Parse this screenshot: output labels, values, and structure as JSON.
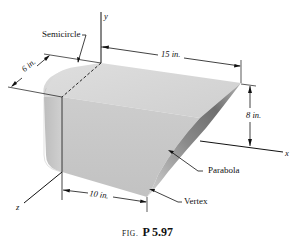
{
  "figure": {
    "caption_prefix": "FIG.",
    "caption_number": "P 5.97"
  },
  "axes": {
    "x_label": "x",
    "y_label": "y",
    "z_label": "z"
  },
  "dimensions": {
    "length_top": "15 in.",
    "height_right": "8 in.",
    "depth_left": "6 in.",
    "length_bottom": "10 in."
  },
  "annotations": {
    "semicircle": "Semicircle",
    "parabola": "Parabola",
    "vertex": "Vertex"
  },
  "colors": {
    "solid_light": "#d9d9d9",
    "solid_mid": "#c4c4c4",
    "solid_dark": "#7a7a7a",
    "line": "#111111"
  }
}
